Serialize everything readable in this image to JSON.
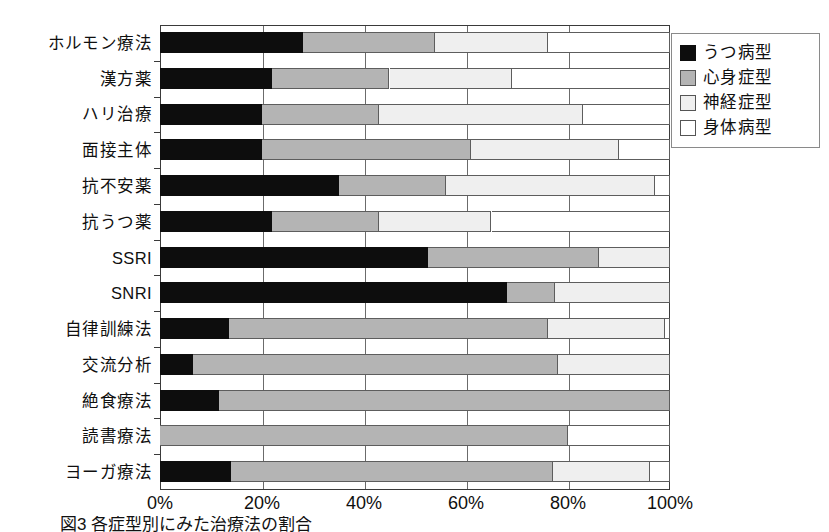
{
  "chart_data": {
    "type": "bar",
    "orientation": "horizontal",
    "stacked": true,
    "normalized_percent": true,
    "title": "",
    "subtitle": "",
    "xlabel": "",
    "ylabel": "",
    "xlim": [
      0,
      100
    ],
    "xticks": [
      0,
      20,
      40,
      60,
      80,
      100
    ],
    "xtick_labels": [
      "0%",
      "20%",
      "40%",
      "60%",
      "80%",
      "100%"
    ],
    "grid": true,
    "grid_axis": "x",
    "legend_position": "top-right",
    "categories": [
      "ホルモン療法",
      "漢方薬",
      "ハリ治療",
      "面接主体",
      "抗不安薬",
      "抗うつ薬",
      "SSRI",
      "SNRI",
      "自律訓練法",
      "交流分析",
      "絶食療法",
      "読書療法",
      "ヨーガ療法"
    ],
    "series": [
      {
        "name": "うつ病型",
        "color": "#0d0d0d",
        "values": [
          28,
          22,
          20,
          20,
          35,
          22,
          52.5,
          68,
          13.5,
          6.5,
          11.5,
          0,
          14
        ]
      },
      {
        "name": "心身症型",
        "color": "#b4b4b4",
        "values": [
          26,
          23,
          23,
          41,
          21,
          21,
          33.5,
          9.5,
          62.5,
          71.5,
          88.5,
          80,
          63
        ]
      },
      {
        "name": "神経症型",
        "color": "#efefef",
        "values": [
          22,
          24,
          40,
          29,
          41,
          22,
          14,
          22.5,
          23,
          22,
          0,
          0,
          19
        ]
      },
      {
        "name": "身体病型",
        "color": "#ffffff",
        "values": [
          24,
          31,
          17,
          10,
          3,
          35,
          0,
          0,
          1,
          0,
          0,
          20,
          4
        ]
      }
    ]
  },
  "legend": {
    "items": [
      {
        "label": "うつ病型",
        "swatch": "sw-dep",
        "color": "#0d0d0d"
      },
      {
        "label": "心身症型",
        "swatch": "sw-psy",
        "color": "#b4b4b4"
      },
      {
        "label": "神経症型",
        "swatch": "sw-neu",
        "color": "#efefef"
      },
      {
        "label": "身体病型",
        "swatch": "sw-som",
        "color": "#ffffff"
      }
    ]
  },
  "caption": {
    "text": "図3 各症型別にみた治療法の割合"
  }
}
